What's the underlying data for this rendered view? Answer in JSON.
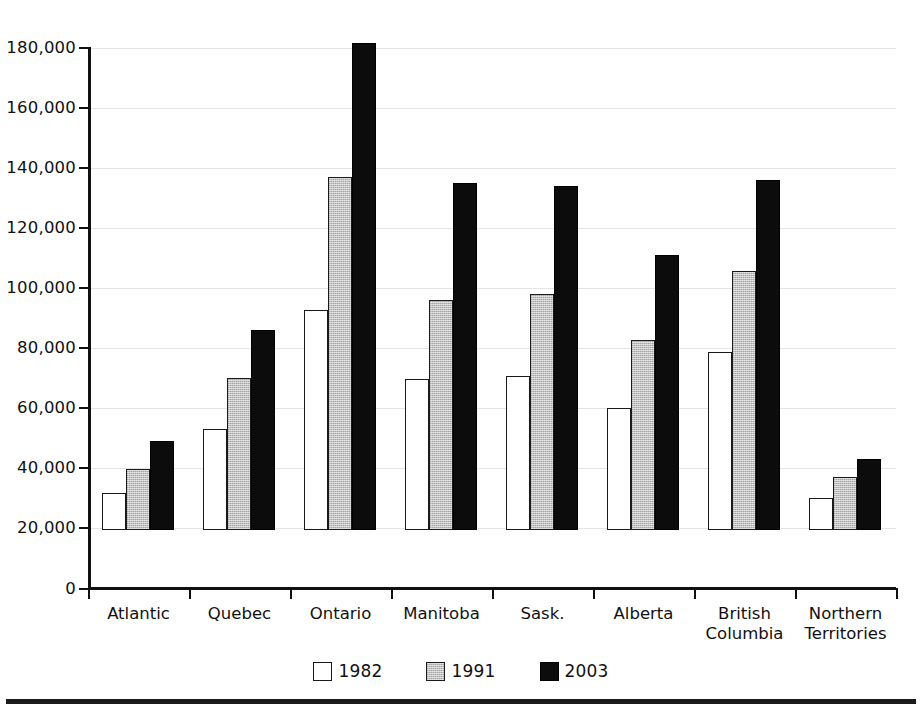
{
  "chart_data": {
    "type": "bar",
    "title": "",
    "subtitle": "",
    "xlabel": "",
    "ylabel": "",
    "ylim": [
      0,
      180000
    ],
    "ytick_values": [
      0,
      20000,
      40000,
      60000,
      80000,
      100000,
      120000,
      140000,
      160000,
      180000
    ],
    "ytick_labels": [
      "0",
      "20,000",
      "40,000",
      "60,000",
      "80,000",
      "100,000",
      "120,000",
      "140,000",
      "160,000",
      "180,000"
    ],
    "grid": true,
    "grid_axis": "y",
    "legend_position": "bottom-center",
    "categories": [
      "Atlantic",
      "Quebec",
      "Ontario",
      "Manitoba",
      "Sask.",
      "Alberta",
      "British\nColumbia",
      "Northern\nTerritories"
    ],
    "series": [
      {
        "name": "1982",
        "color": "#ffffff",
        "values": [
          12000,
          33500,
          73000,
          50000,
          51000,
          40500,
          59000,
          10500
        ]
      },
      {
        "name": "1991",
        "color": "#b9b9b9",
        "values": [
          20000,
          50500,
          117500,
          76500,
          78500,
          63000,
          86000,
          17500
        ]
      },
      {
        "name": "2003",
        "color": "#0c0c0c",
        "values": [
          29500,
          66500,
          162000,
          115500,
          114500,
          91500,
          116500,
          23500
        ]
      }
    ]
  },
  "legend": {
    "items": [
      {
        "label": "1982",
        "swatch": "white-square-icon"
      },
      {
        "label": "1991",
        "swatch": "gray-square-icon"
      },
      {
        "label": "2003",
        "swatch": "black-square-icon"
      }
    ]
  },
  "colors": {
    "axis": "#111111",
    "grid": "#e4e4e4",
    "background": "#ffffff",
    "rule": "#1a1a1a"
  }
}
